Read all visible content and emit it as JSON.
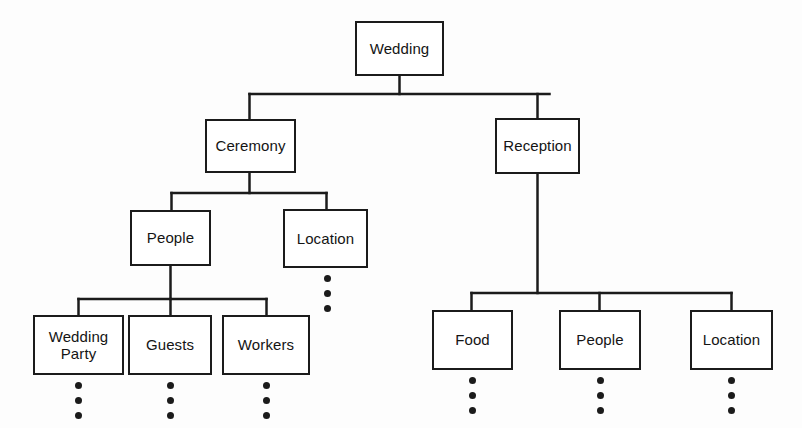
{
  "diagram": {
    "title": "Wedding",
    "type": "hierarchy-tree",
    "line_color": "#1b1b1b",
    "box_fill": "#ffffff",
    "text_color": "#141414",
    "background": "#fdfdfd",
    "nodes": [
      {
        "id": "wedding",
        "label": "Wedding",
        "level": 0,
        "x": 355,
        "y": 21,
        "w": 89,
        "h": 55,
        "has_ellipsis": false
      },
      {
        "id": "ceremony",
        "label": "Ceremony",
        "level": 1,
        "x": 205,
        "y": 119,
        "w": 91,
        "h": 54,
        "has_ellipsis": false
      },
      {
        "id": "reception",
        "label": "Reception",
        "level": 1,
        "x": 495,
        "y": 118,
        "w": 85,
        "h": 56,
        "has_ellipsis": false
      },
      {
        "id": "ceremony-people",
        "label": "People",
        "level": 2,
        "x": 130,
        "y": 210,
        "w": 81,
        "h": 56,
        "has_ellipsis": false
      },
      {
        "id": "ceremony-location",
        "label": "Location",
        "level": 2,
        "x": 283,
        "y": 209,
        "w": 85,
        "h": 59,
        "has_ellipsis": true
      },
      {
        "id": "wedding-party",
        "label": "Wedding\nParty",
        "level": 3,
        "x": 33,
        "y": 315,
        "w": 91,
        "h": 60,
        "has_ellipsis": true
      },
      {
        "id": "guests",
        "label": "Guests",
        "level": 3,
        "x": 128,
        "y": 315,
        "w": 84,
        "h": 60,
        "has_ellipsis": true
      },
      {
        "id": "workers",
        "label": "Workers",
        "level": 3,
        "x": 222,
        "y": 315,
        "w": 88,
        "h": 60,
        "has_ellipsis": true
      },
      {
        "id": "reception-food",
        "label": "Food",
        "level": 3,
        "x": 432,
        "y": 310,
        "w": 81,
        "h": 60,
        "has_ellipsis": true
      },
      {
        "id": "reception-people",
        "label": "People",
        "level": 3,
        "x": 559,
        "y": 310,
        "w": 82,
        "h": 60,
        "has_ellipsis": true
      },
      {
        "id": "reception-location",
        "label": "Location",
        "level": 3,
        "x": 690,
        "y": 310,
        "w": 83,
        "h": 60,
        "has_ellipsis": true
      }
    ],
    "edges": [
      {
        "from": "wedding",
        "to": "ceremony"
      },
      {
        "from": "wedding",
        "to": "reception"
      },
      {
        "from": "ceremony",
        "to": "ceremony-people"
      },
      {
        "from": "ceremony",
        "to": "ceremony-location"
      },
      {
        "from": "ceremony-people",
        "to": "wedding-party"
      },
      {
        "from": "ceremony-people",
        "to": "guests"
      },
      {
        "from": "ceremony-people",
        "to": "workers"
      },
      {
        "from": "reception",
        "to": "reception-food"
      },
      {
        "from": "reception",
        "to": "reception-people"
      },
      {
        "from": "reception",
        "to": "reception-location"
      }
    ],
    "ellipsis": {
      "symbol": "vertical-three-dots",
      "count": 3,
      "meaning": "more sub-items continue below"
    }
  }
}
